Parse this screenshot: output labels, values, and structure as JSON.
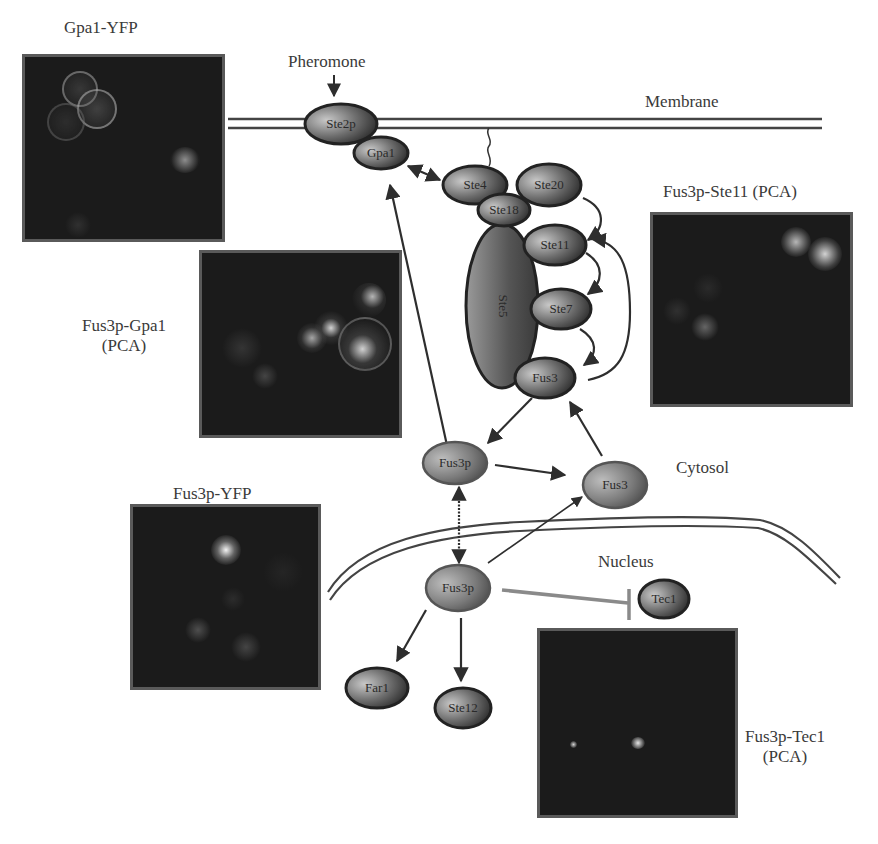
{
  "labels": {
    "pheromone": "Pheromone",
    "membrane": "Membrane",
    "cytosol": "Cytosol",
    "nucleus": "Nucleus"
  },
  "panels": [
    {
      "id": "gpa1-yfp",
      "title": "Gpa1-YFP"
    },
    {
      "id": "fus3p-gpa1",
      "title_line1": "Fus3p-Gpa1",
      "title_line2": "(PCA)"
    },
    {
      "id": "fus3p-ste11",
      "title": "Fus3p-Ste11 (PCA)"
    },
    {
      "id": "fus3p-yfp",
      "title": "Fus3p-YFP"
    },
    {
      "id": "fus3p-tec1",
      "title_line1": "Fus3p-Tec1",
      "title_line2": "(PCA)"
    }
  ],
  "nodes": {
    "ste2": "Ste2p",
    "gpa1": "Gpa1",
    "ste4": "Ste4",
    "ste18": "Ste18",
    "ste20": "Ste20",
    "ste5": "Ste5",
    "ste11": "Ste11",
    "ste7": "Ste7",
    "fus3_scaffold": "Fus3",
    "fus3_cyto_left": "Fus3p",
    "fus3_cyto_right": "Fus3",
    "fus3_nuclear": "Fus3p",
    "tec1": "Tec1",
    "far1": "Far1",
    "ste12": "Ste12"
  },
  "colors": {
    "node_dark": "#2e2e2e",
    "node_light": "#b5b5b5",
    "line": "#333333",
    "inhibition": "#8a8a8a",
    "micro_bg": "#1b1b1b"
  }
}
